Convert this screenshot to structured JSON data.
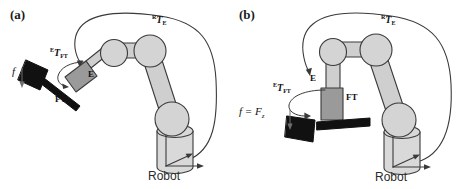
{
  "figure": {
    "background_color": "#ffffff",
    "stroke_color": "#3a3a3a",
    "joint_fill": "#d4d4d4",
    "link_fill": "#cfcfcf",
    "sensor_fill": "#9a9a9a",
    "tool_fill": "#111111",
    "base_fill": "#d9d9d9"
  },
  "panels": [
    {
      "id": "a",
      "label": "(a)",
      "labels": {
        "robot_base": "Robot",
        "end_effector": "E",
        "ft_sensor": "FT",
        "frame_robot_to_ee": {
          "sup": "R",
          "mid": "T",
          "sub": "E"
        },
        "frame_ee_to_ft": {
          "sup": "E",
          "mid": "T",
          "sub": "FT"
        },
        "force": {
          "symbol": "f",
          "subscript": ""
        }
      }
    },
    {
      "id": "b",
      "label": "(b)",
      "labels": {
        "robot_base": "Robot",
        "end_effector": "E",
        "ft_sensor": "FT",
        "frame_robot_to_ee": {
          "sup": "R",
          "mid": "T",
          "sub": "E"
        },
        "frame_ee_to_ft": {
          "sup": "E",
          "mid": "T",
          "sub": "FT"
        },
        "force": {
          "symbol": "f = F",
          "subscript": "z"
        }
      }
    }
  ]
}
